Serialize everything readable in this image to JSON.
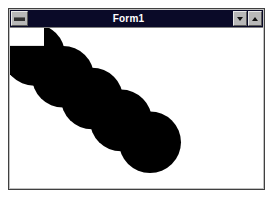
{
  "window": {
    "title": "Form1",
    "system_menu_icon": "system-menu-icon",
    "minimize_label": "",
    "minimize_icon": "minimize-arrow-icon",
    "maximize_label": "",
    "maximize_icon": "maximize-arrow-icon"
  },
  "colors": {
    "titlebar": "#0a0a28",
    "titlebar_text": "#ffffff",
    "window_face": "#c0c0c0",
    "window_border": "#404040",
    "client_background": "#ffffff",
    "shape_fill": "#000000",
    "desktop_background": "#ffffff"
  },
  "drawing": {
    "description": "chain of overlapping filled black circles drawn diagonally",
    "shape": "circle",
    "fill": "#000000",
    "count": 5,
    "radius": 31,
    "step_x": 29,
    "step_y": 22,
    "circles": [
      {
        "cx": 24,
        "cy": 27,
        "r": 31
      },
      {
        "cx": 53,
        "cy": 49,
        "r": 31
      },
      {
        "cx": 82,
        "cy": 71,
        "r": 31
      },
      {
        "cx": 111,
        "cy": 93,
        "r": 31
      },
      {
        "cx": 140,
        "cy": 115,
        "r": 31
      }
    ],
    "notch": {
      "x": 0,
      "y": 0,
      "width": 34,
      "height": 18,
      "fill": "#ffffff"
    }
  }
}
